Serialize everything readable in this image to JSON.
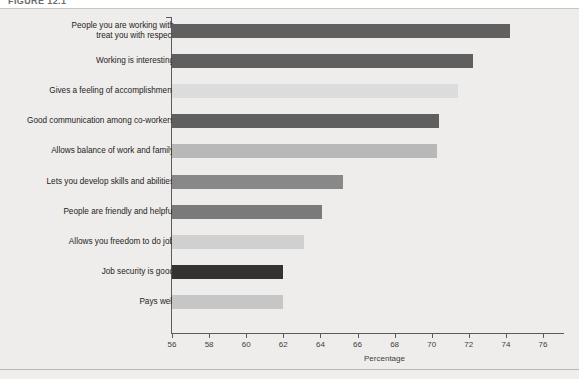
{
  "figure": {
    "caption": "FIGURE 12.1",
    "background_color": "#eeedeb"
  },
  "axis": {
    "x_title": "Percentage",
    "x_ticks": [
      "56",
      "58",
      "60",
      "62",
      "64",
      "66",
      "68",
      "70",
      "72",
      "74",
      "76"
    ],
    "x_min": 56,
    "x_max": 76,
    "spine_color": "#5d5b58"
  },
  "chart_data": {
    "type": "bar",
    "orientation": "horizontal",
    "title": "",
    "subtitle": "",
    "xlabel": "Percentage",
    "ylabel": "",
    "xlim": [
      56,
      76
    ],
    "xticks": [
      56,
      58,
      60,
      62,
      64,
      66,
      68,
      70,
      72,
      74,
      76
    ],
    "grid": false,
    "legend": "none",
    "categories": [
      "People you are working with\ntreat you with respect",
      "Working is interesting",
      "Gives a feeling of accomplishment",
      "Good communication among co-workers",
      "Allows balance of work and family",
      "Lets you develop skills and abilities",
      "People are friendly and helpful",
      "Allows you freedom to do job",
      "Job security is good",
      "Pays well"
    ],
    "values": [
      74.2,
      72.2,
      71.4,
      70.4,
      70.3,
      65.2,
      64.1,
      63.1,
      62.0,
      62.0
    ],
    "bar_colors": [
      "#606060",
      "#5f5f5f",
      "#dcdcdc",
      "#5f5f5f",
      "#b8b8b8",
      "#888888",
      "#7a7a7a",
      "#d0d0d0",
      "#333333",
      "#c6c6c6"
    ]
  }
}
